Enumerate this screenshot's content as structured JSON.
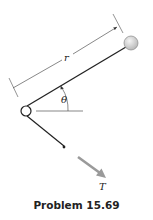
{
  "figure": {
    "labels": {
      "length": "r",
      "angle": "θ",
      "force": "T"
    },
    "caption": "Problem 15.69",
    "colors": {
      "line": "#222222",
      "dimension": "#555555",
      "arrow": "#9a9a9a",
      "ball_fill": "#d8d8d8",
      "ball_stroke": "#888888"
    }
  }
}
